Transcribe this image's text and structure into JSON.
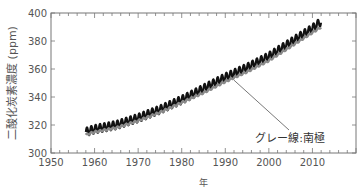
{
  "chart_data": {
    "type": "line",
    "title": "",
    "xlabel": "年",
    "ylabel": "二酸化炭素濃度 (ppm)",
    "xlim": [
      1950,
      2020
    ],
    "ylim": [
      300,
      400
    ],
    "x_ticks": [
      1950,
      1960,
      1970,
      1980,
      1990,
      2000,
      2010
    ],
    "x_tick_labels": [
      "1950",
      "1960",
      "1970",
      "1980",
      "1990",
      "2000",
      "2010"
    ],
    "y_ticks": [
      300,
      320,
      340,
      360,
      380,
      400
    ],
    "y_tick_labels": [
      "300",
      "320",
      "340",
      "360",
      "380",
      "400"
    ],
    "grid": false,
    "series": [
      {
        "name": "黒線 (Mauna Loa)",
        "color": "#111111",
        "seasonal_amplitude_ppm": 3,
        "x": [
          1958,
          1960,
          1965,
          1970,
          1975,
          1980,
          1985,
          1990,
          1995,
          2000,
          2005,
          2010,
          2012
        ],
        "values": [
          315,
          317,
          320,
          325,
          331,
          338,
          346,
          354,
          361,
          369,
          379,
          389,
          394
        ]
      },
      {
        "name": "グレー線:南極",
        "color": "#8a8a8a",
        "seasonal_amplitude_ppm": 0.6,
        "x": [
          1958,
          1960,
          1965,
          1970,
          1975,
          1980,
          1985,
          1990,
          1995,
          2000,
          2005,
          2010,
          2012
        ],
        "values": [
          313,
          315,
          318,
          323,
          329,
          336,
          343,
          351,
          358,
          366,
          376,
          386,
          390
        ]
      }
    ],
    "annotations": [
      {
        "text": "グレー線:南極",
        "points_to_x": 1992,
        "points_to_y": 352
      }
    ]
  }
}
